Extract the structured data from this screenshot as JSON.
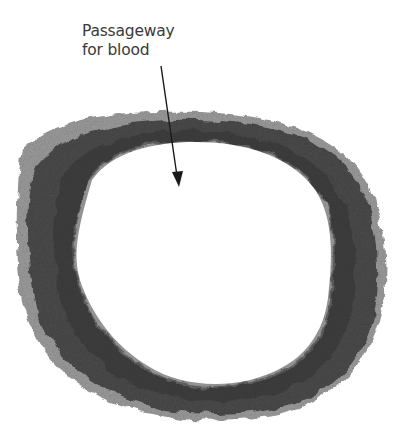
{
  "figure": {
    "label": {
      "line1": "Passageway",
      "line2": "for blood"
    },
    "arrow": {
      "from": [
        161,
        66
      ],
      "to": [
        179,
        186
      ]
    },
    "colors": {
      "wall": "#4a4a4a",
      "wall_dark": "#3a3a3a",
      "outer_tissue": "#9a9a9a",
      "lumen": "#ffffff",
      "label_text": "#3a3a3a"
    }
  }
}
